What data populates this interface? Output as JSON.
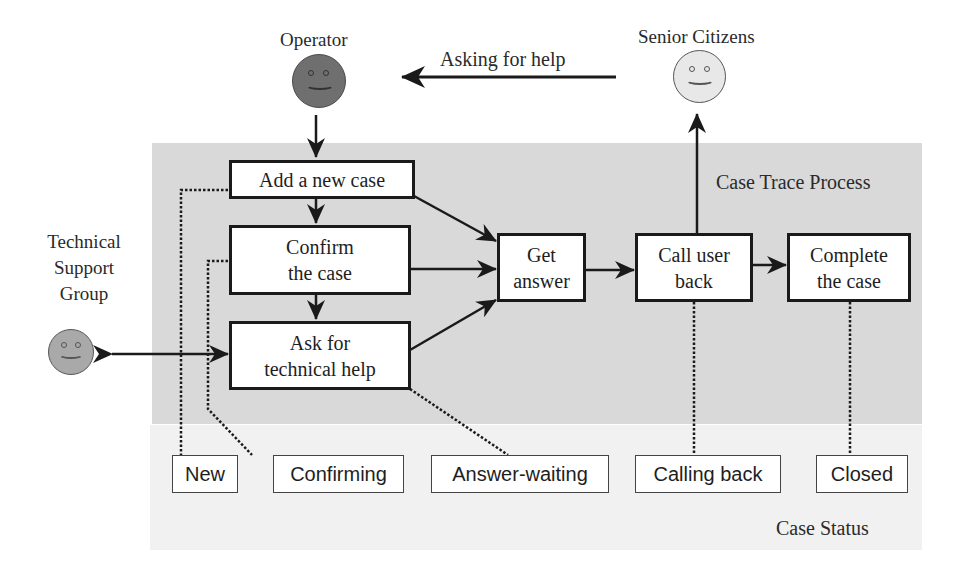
{
  "diagram": {
    "region_title": "Case Trace Process",
    "status_section_title": "Case Status",
    "colors": {
      "region_fill": "#d9d9d9",
      "operator_face": "#6f6f6f",
      "senior_face": "#e8e8e8",
      "tech_face": "#a9a9a9",
      "line": "#1a1a1a"
    },
    "actors": {
      "operator": {
        "label": "Operator",
        "icon": "smiley-face-icon"
      },
      "senior_citizens": {
        "label": "Senior Citizens",
        "icon": "smiley-face-icon"
      },
      "technical_support": {
        "label_lines": [
          "Technical",
          "Support",
          "Group"
        ],
        "icon": "smiley-face-icon"
      }
    },
    "edge_labels": {
      "asking_for_help": "Asking for help"
    },
    "process_steps": [
      {
        "id": "add",
        "lines": [
          "Add a new case"
        ]
      },
      {
        "id": "confirm",
        "lines": [
          "Confirm",
          "the case"
        ]
      },
      {
        "id": "ask",
        "lines": [
          "Ask for",
          "technical help"
        ]
      },
      {
        "id": "get",
        "lines": [
          "Get",
          "answer"
        ]
      },
      {
        "id": "call",
        "lines": [
          "Call user",
          "back"
        ]
      },
      {
        "id": "complete",
        "lines": [
          "Complete",
          "the case"
        ]
      }
    ],
    "statuses": [
      {
        "id": "new",
        "label": "New",
        "linked_step": "add"
      },
      {
        "id": "confirming",
        "label": "Confirming",
        "linked_step": "confirm"
      },
      {
        "id": "answer_waiting",
        "label": "Answer-waiting",
        "linked_step": "ask"
      },
      {
        "id": "calling_back",
        "label": "Calling back",
        "linked_step": "call"
      },
      {
        "id": "closed",
        "label": "Closed",
        "linked_step": "complete"
      }
    ],
    "edges": [
      {
        "from": "senior_citizens",
        "to": "operator",
        "label": "Asking for help"
      },
      {
        "from": "operator",
        "to": "add"
      },
      {
        "from": "add",
        "to": "confirm"
      },
      {
        "from": "confirm",
        "to": "ask"
      },
      {
        "from": "add",
        "to": "get"
      },
      {
        "from": "confirm",
        "to": "get"
      },
      {
        "from": "ask",
        "to": "get"
      },
      {
        "from": "ask",
        "to": "technical_support",
        "bidirectional": true
      },
      {
        "from": "get",
        "to": "call"
      },
      {
        "from": "call",
        "to": "complete"
      },
      {
        "from": "call",
        "to": "senior_citizens"
      }
    ]
  }
}
